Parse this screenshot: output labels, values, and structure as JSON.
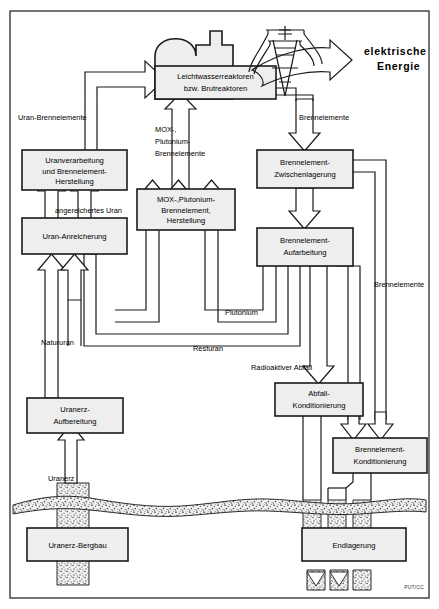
{
  "diagram": {
    "title_credit": "PUT/CC",
    "boxes": [
      {
        "id": "reactor",
        "lines": [
          "Leichtwasserreaktoren",
          "bzw. Brutreaktoren"
        ]
      },
      {
        "id": "uranverarbeitung",
        "lines": [
          "Uranverarbeitung",
          "und Brennelement-",
          "Herstellung"
        ]
      },
      {
        "id": "mox",
        "lines": [
          "MOX-,Plutonium-",
          "Brennelement,",
          "Herstellung"
        ]
      },
      {
        "id": "anreicherung",
        "lines": [
          "Uran-Anreicherung"
        ]
      },
      {
        "id": "zwischenlager",
        "lines": [
          "Brennelement-",
          "Zwischenlagerung"
        ]
      },
      {
        "id": "aufarbeitung",
        "lines": [
          "Brennelement-",
          "Aufarbeitung"
        ]
      },
      {
        "id": "abfall",
        "lines": [
          "Abfall-",
          "Konditionierung"
        ]
      },
      {
        "id": "bekond",
        "lines": [
          "Brennelement-",
          "Konditionierung"
        ]
      },
      {
        "id": "aufbereitung",
        "lines": [
          "Uranerz-",
          "Aufbereitung"
        ]
      },
      {
        "id": "bergbau",
        "lines": [
          "Uranerz-Bergbau"
        ]
      },
      {
        "id": "endlager",
        "lines": [
          "Endlagerung"
        ]
      }
    ],
    "flow_labels": {
      "uran_brennelemente": "Uran-Brennelemente",
      "mox_plutonium": [
        "MOX-,",
        "Plutonium-",
        "Brennelemente"
      ],
      "brennelemente_top": "Brennelemente",
      "brennelemente_right": "Brennelemente",
      "angereichertes_uran": "angereichertes Uran",
      "plutonium": "Plutonium",
      "resturan": "Resturan",
      "natururan": "Natururan",
      "radioaktiver_abfall": "Radioaktiver Abfall",
      "uranerz": "Uranerz"
    },
    "energy_output": [
      "elektrische",
      "Energie"
    ],
    "colors": {
      "box_fill": "#eeeeee",
      "stroke": "#1a1a1a",
      "ground": "#8a8a8a",
      "background": "#ffffff"
    }
  }
}
